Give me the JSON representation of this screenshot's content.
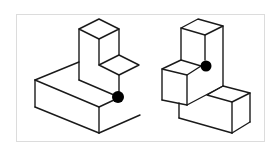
{
  "diagram": {
    "type": "isometric block drawings",
    "figure_count": 2,
    "colors": {
      "line": "#1a1a1a",
      "marker": "#000000",
      "frame": "#dcdcdc",
      "background": "#ffffff"
    },
    "figures": [
      {
        "id": "left",
        "description": "L-shaped step block with tall column at back and small step, black dot marking inner corner",
        "marker": {
          "cx": 118,
          "cy": 97,
          "r": 6
        }
      },
      {
        "id": "right",
        "description": "Stacked block assembly with tall back column, front cube and low slab, black dot marking junction corner",
        "marker": {
          "cx": 206,
          "cy": 66,
          "r": 5.5
        }
      }
    ]
  }
}
